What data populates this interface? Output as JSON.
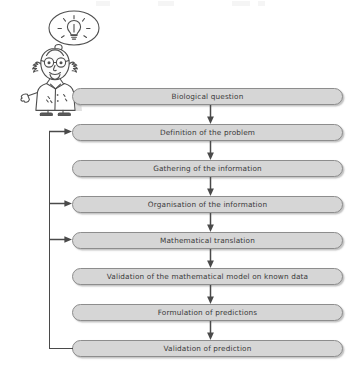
{
  "figure": {
    "box_fill": "#d6d6d6",
    "box_border": "#8d8d8d",
    "text_color": "#3a3a3a",
    "arrow_color": "#4a4a4a",
    "background": "#ffffff"
  },
  "illustration": {
    "character": "cartoon-scientist",
    "character_desc": "bald bearded scientist in white lab coat with round glasses, arms outstretched",
    "thought_bubble": "lightbulb-idea"
  },
  "flow": {
    "steps": [
      {
        "id": "biological-question",
        "label": "Biological question",
        "top": 88,
        "feedback_target": false
      },
      {
        "id": "definition-problem",
        "label": "Definition of the problem",
        "top": 124,
        "feedback_target": true
      },
      {
        "id": "gathering-information",
        "label": "Gathering of the information",
        "top": 160,
        "feedback_target": false
      },
      {
        "id": "organisation-information",
        "label": "Organisation of the information",
        "top": 196,
        "feedback_target": true
      },
      {
        "id": "mathematical-translation",
        "label": "Mathematical translation",
        "top": 232,
        "feedback_target": true
      },
      {
        "id": "validation-model",
        "label": "Validation of the mathematical model on known data",
        "top": 268,
        "feedback_target": false
      },
      {
        "id": "formulation-predictions",
        "label": "Formulation of predictions",
        "top": 304,
        "feedback_target": false
      },
      {
        "id": "validation-prediction",
        "label": "Validation of prediction",
        "top": 340,
        "feedback_target": false
      }
    ],
    "connector_tops": [
      106,
      142,
      178,
      214,
      250,
      286,
      322
    ],
    "feedback": {
      "from_step": "validation-prediction",
      "to_steps": [
        "definition-problem",
        "organisation-information",
        "mathematical-translation"
      ],
      "arrow_tops": [
        131,
        203,
        239
      ],
      "vertical_x": 49,
      "vertical_top": 131,
      "vertical_bottom": 348
    }
  }
}
